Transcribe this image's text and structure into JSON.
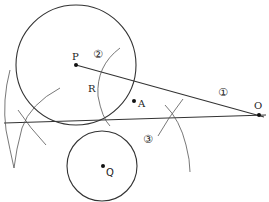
{
  "diagram": {
    "type": "geometric-construction",
    "colors": {
      "stroke": "#333333",
      "arc": "#555555",
      "background": "#ffffff"
    },
    "points": [
      {
        "id": "P",
        "label": "P",
        "x": 76,
        "y": 65
      },
      {
        "id": "A",
        "label": "A",
        "x": 135,
        "y": 101
      },
      {
        "id": "R",
        "label": "R",
        "x": 100,
        "y": 82
      },
      {
        "id": "O",
        "label": "O",
        "x": 258,
        "y": 115
      },
      {
        "id": "Q",
        "label": "Q",
        "x": 102,
        "y": 166
      }
    ],
    "circles": [
      {
        "id": "circle-P",
        "cx": 76,
        "cy": 65,
        "r": 60
      },
      {
        "id": "circle-Q",
        "cx": 102,
        "cy": 166,
        "r": 35
      }
    ],
    "step_labels": [
      {
        "id": "step-1",
        "text": "①",
        "x": 220,
        "y": 92
      },
      {
        "id": "step-2",
        "text": "②",
        "x": 100,
        "y": 56
      },
      {
        "id": "step-3",
        "text": "③",
        "x": 150,
        "y": 139
      }
    ]
  },
  "labels": {
    "P": "P",
    "A": "A",
    "R": "R",
    "O": "O",
    "Q": "Q",
    "step1": "①",
    "step2": "②",
    "step3": "③"
  }
}
